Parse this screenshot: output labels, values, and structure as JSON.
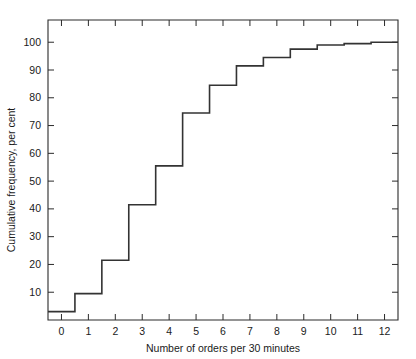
{
  "chart_data": {
    "type": "line",
    "subtype": "cumulative-frequency-step-ogive",
    "title": "",
    "xlabel": "Number of orders  per 30 minutes",
    "ylabel": "Cumulative frequency, per cent",
    "xlim": [
      -0.5,
      12.5
    ],
    "ylim": [
      0,
      108
    ],
    "grid": false,
    "legend": null,
    "x_ticks": [
      0,
      1,
      2,
      3,
      4,
      5,
      6,
      7,
      8,
      9,
      10,
      11,
      12
    ],
    "x_tick_labels": [
      "0",
      "1",
      "2",
      "3",
      "4",
      "5",
      "6",
      "7",
      "8",
      "9",
      "10",
      "11",
      "12"
    ],
    "y_ticks": [
      10,
      20,
      30,
      40,
      50,
      60,
      70,
      80,
      90,
      100
    ],
    "y_tick_labels": [
      "10",
      "20",
      "30",
      "40",
      "50",
      "60",
      "70",
      "80",
      "90",
      "100"
    ],
    "categories": [
      0,
      1,
      2,
      3,
      4,
      5,
      6,
      7,
      8,
      9,
      10,
      11,
      12
    ],
    "values": [
      3,
      9.5,
      21.5,
      41.5,
      55.5,
      74.5,
      84.5,
      91.5,
      94.5,
      97.5,
      99,
      99.5,
      100
    ],
    "step_edges": [
      -0.5,
      0.5,
      1.5,
      2.5,
      3.5,
      4.5,
      5.5,
      6.5,
      7.5,
      8.5,
      9.5,
      10.5,
      11.5,
      12.5
    ],
    "step_levels": [
      3,
      9.5,
      21.5,
      41.5,
      55.5,
      74.5,
      84.5,
      91.5,
      94.5,
      97.5,
      99,
      99.5,
      100
    ],
    "series": [
      {
        "name": "Cumulative frequency",
        "values": [
          3,
          9.5,
          21.5,
          41.5,
          55.5,
          74.5,
          84.5,
          91.5,
          94.5,
          97.5,
          99,
          99.5,
          100
        ]
      }
    ],
    "line_color": "#333333",
    "background_color": "#ffffff"
  },
  "axes": {
    "x_title": "Number of orders  per 30 minutes",
    "y_title": "Cumulative frequency, per cent"
  }
}
